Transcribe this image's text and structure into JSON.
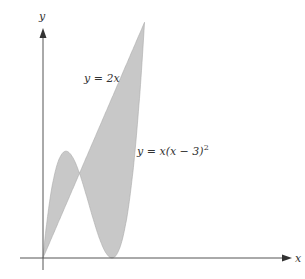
{
  "chart_data": {
    "type": "area",
    "title": "",
    "xlabel": "x",
    "ylabel": "y",
    "curves": [
      {
        "name": "line",
        "equation": "y = 2x"
      },
      {
        "name": "cubic",
        "equation": "y = x(x − 3)²"
      }
    ],
    "intersections_x": [
      0,
      1.586,
      4.414
    ],
    "cubic_local_max": {
      "x": 1,
      "y": 4
    },
    "cubic_root": {
      "x": 3,
      "y": 0
    },
    "xlim": [
      -1.0,
      8.0
    ],
    "ylim": [
      -0.5,
      9.5
    ],
    "shaded_region": "between y = 2x and y = x(x − 3)² from x = 0 to x = 3 + √2",
    "fill_color": "#c8c8c8",
    "grid": false
  },
  "labels": {
    "x_axis": "x",
    "y_axis": "y",
    "line_label": "y = 2x",
    "cubic_label_base": "y = x(x − 3)",
    "cubic_label_exp": "2"
  }
}
